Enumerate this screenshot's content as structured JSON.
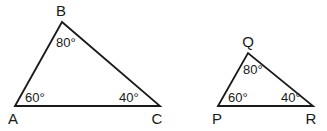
{
  "figure": {
    "background_color": "#ffffff",
    "line_color": "#1a1a1a",
    "triangle_abc": {
      "vertex_a": {
        "label": "A",
        "angle": "60°"
      },
      "vertex_b": {
        "label": "B",
        "angle": "80°"
      },
      "vertex_c": {
        "label": "C",
        "angle": "40°"
      }
    },
    "triangle_pqr": {
      "vertex_p": {
        "label": "P",
        "angle": "60°"
      },
      "vertex_q": {
        "label": "Q",
        "angle": "80°"
      },
      "vertex_r": {
        "label": "R",
        "angle": "40°"
      }
    }
  }
}
